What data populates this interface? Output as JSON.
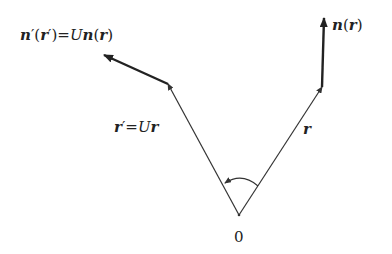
{
  "diagram": {
    "labels": {
      "left_normal": {
        "n": "n",
        "prime1": "′",
        "lp": "(",
        "r": "r",
        "prime2": "′",
        "rp": ")",
        "eq": "=",
        "U": "U",
        "n2": "n",
        "lp2": "(",
        "r2": "r",
        "rp2": ")"
      },
      "right_normal": {
        "n": "n",
        "lp": "(",
        "r": "r",
        "rp": ")"
      },
      "left_vector": {
        "r": "r",
        "prime": "′",
        "eq": "=",
        "U": "U",
        "r2": "r"
      },
      "right_vector": {
        "r": "r"
      },
      "origin": "0"
    },
    "colors": {
      "line": "#333333",
      "text": "#222222"
    }
  }
}
